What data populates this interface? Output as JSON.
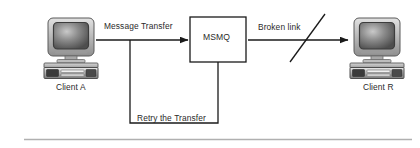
{
  "diagram": {
    "background": "#ffffff",
    "line_color": "#1a1a1a",
    "text_color": "#2b2b2b",
    "nodes": [
      {
        "id": "client-a",
        "type": "computer",
        "label": "Client A"
      },
      {
        "id": "msmq",
        "type": "box",
        "label": "MSMQ"
      },
      {
        "id": "client-b",
        "type": "computer",
        "label": "Client R"
      }
    ],
    "edges": [
      {
        "id": "message-transfer",
        "label": "Message Transfer",
        "from": "client-a",
        "to": "msmq",
        "arrow": true,
        "broken": false
      },
      {
        "id": "broken-link",
        "label": "Broken link",
        "from": "msmq",
        "to": "client-b",
        "arrow": true,
        "broken": true
      },
      {
        "id": "retry-transfer",
        "label": "Retry the Transfer",
        "from": "msmq",
        "to": "message-transfer",
        "arrow": false,
        "broken": false
      }
    ],
    "footer_rule": true
  }
}
